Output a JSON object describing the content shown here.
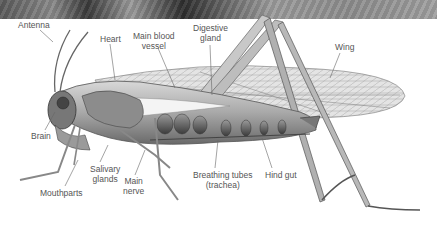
{
  "diagram": {
    "labels": [
      {
        "id": "antenna",
        "text": "Antenna",
        "x": 18,
        "y": 20
      },
      {
        "id": "heart",
        "text": "Heart",
        "x": 100,
        "y": 34
      },
      {
        "id": "main-blood-vessel",
        "text": "Main blood\nvessel",
        "x": 133,
        "y": 31
      },
      {
        "id": "digestive-gland",
        "text": "Digestive\ngland",
        "x": 193,
        "y": 23
      },
      {
        "id": "wing",
        "text": "Wing",
        "x": 335,
        "y": 42
      },
      {
        "id": "brain",
        "text": "Brain",
        "x": 31,
        "y": 131
      },
      {
        "id": "salivary-glands",
        "text": "Salivary\nglands",
        "x": 90,
        "y": 164
      },
      {
        "id": "main-nerve",
        "text": "Main\nnerve",
        "x": 123,
        "y": 176
      },
      {
        "id": "mouthparts",
        "text": "Mouthparts",
        "x": 40,
        "y": 188
      },
      {
        "id": "breathing-tubes",
        "text": "Breathing tubes\n(trachea)",
        "x": 193,
        "y": 170
      },
      {
        "id": "hind-gut",
        "text": "Hind gut",
        "x": 265,
        "y": 170
      }
    ],
    "colors": {
      "label_text": "#555555",
      "leader_line": "#666666",
      "background": "#ffffff"
    }
  }
}
